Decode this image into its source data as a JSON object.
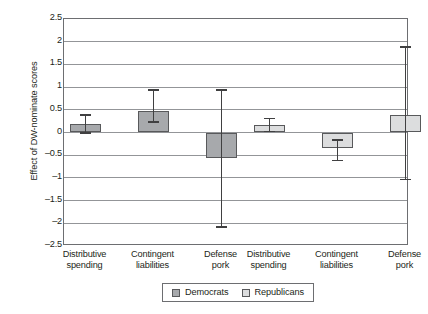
{
  "chart_data": {
    "type": "bar",
    "title": "",
    "xlabel": "",
    "ylabel": "Effect of DW-nominate scores",
    "ylim": [
      -2.5,
      2.5
    ],
    "ytick_step": 0.5,
    "grid": true,
    "legend_position": "bottom-center",
    "categories": [
      "Distributive spending",
      "Contingent liabilities",
      "Defense pork"
    ],
    "category_lines": [
      [
        "Distributive",
        "spending"
      ],
      [
        "Contingent",
        "liabilities"
      ],
      [
        "Defense",
        "pork"
      ]
    ],
    "yticks": [
      "2.5",
      "2",
      "1.5",
      "1",
      "0.5",
      "0",
      "-0.5",
      "-1",
      "-1.5",
      "-2",
      "-2.5"
    ],
    "series": [
      {
        "name": "Democrats",
        "color": "#a7a9ac",
        "values": [
          0.18,
          0.47,
          -0.57
        ],
        "ci_upper": [
          0.4,
          0.95,
          0.95
        ],
        "ci_lower": [
          -0.03,
          0.21,
          -2.1
        ]
      },
      {
        "name": "Republicans",
        "color": "#dcddde",
        "values": [
          0.17,
          -0.35,
          0.38
        ],
        "ci_upper": [
          0.33,
          -0.15,
          1.9
        ],
        "ci_lower": [
          0.0,
          -0.63,
          -1.05
        ]
      }
    ]
  },
  "legend": {
    "items": [
      {
        "label": "Democrats",
        "swatch": "democrats-swatch"
      },
      {
        "label": "Republicans",
        "swatch": "republicans-swatch"
      }
    ]
  }
}
